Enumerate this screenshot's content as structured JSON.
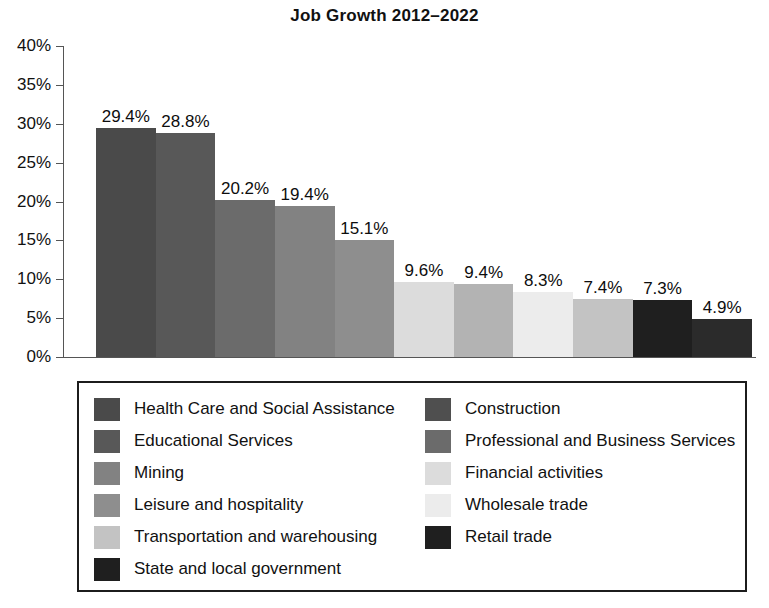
{
  "chart_data": {
    "type": "bar",
    "title": "Job Growth 2012–2022",
    "xlabel": "",
    "ylabel": "",
    "ylim": [
      0,
      40
    ],
    "grid": false,
    "legend_position": "bottom",
    "ytick_labels": [
      "40%",
      "35%",
      "30%",
      "25%",
      "20%",
      "15%",
      "10%",
      "5%",
      "0%"
    ],
    "ytick_values": [
      40,
      35,
      30,
      25,
      20,
      15,
      10,
      5,
      0
    ],
    "categories": [
      "Health Care and Social Assistance",
      "Educational Services",
      "Construction",
      "Mining",
      "Professional and Business Services",
      "Leisure and hospitality",
      "Financial activities",
      "Transportation and warehousing",
      "Wholesale trade",
      "State and local government",
      "Retail trade"
    ],
    "values": [
      29.4,
      28.8,
      20.2,
      19.4,
      15.1,
      9.6,
      9.4,
      8.3,
      7.4,
      7.3,
      4.9
    ],
    "value_labels": [
      "29.4%",
      "28.8%",
      "20.2%",
      "19.4%",
      "15.1%",
      "9.6%",
      "9.4%",
      "8.3%",
      "7.4%",
      "7.3%",
      "4.9%"
    ],
    "bar_colors": [
      "#4a4a4a",
      "#585858",
      "#6b6b6b",
      "#828282",
      "#8e8e8e",
      "#dcdcdc",
      "#b3b3b3",
      "#ececec",
      "#c3c3c3",
      "#1f1f1f",
      "#2b2b2b"
    ]
  },
  "legend": {
    "columns": [
      {
        "items": [
          {
            "label": "Health Care and Social Assistance",
            "color": "#4a4a4a"
          },
          {
            "label": "Educational Services",
            "color": "#585858"
          },
          {
            "label": "Mining",
            "color": "#828282"
          },
          {
            "label": "Leisure and hospitality",
            "color": "#8e8e8e"
          },
          {
            "label": "Transportation and warehousing",
            "color": "#c3c3c3"
          },
          {
            "label": "State and local government",
            "color": "#1f1f1f"
          }
        ]
      },
      {
        "items": [
          {
            "label": "Construction",
            "color": "#4f4f4f"
          },
          {
            "label": "Professional and Business Services",
            "color": "#6b6b6b"
          },
          {
            "label": "Financial activities",
            "color": "#dcdcdc"
          },
          {
            "label": "Wholesale trade",
            "color": "#ececec"
          },
          {
            "label": "Retail trade",
            "color": "#1f1f1f"
          }
        ]
      }
    ]
  }
}
